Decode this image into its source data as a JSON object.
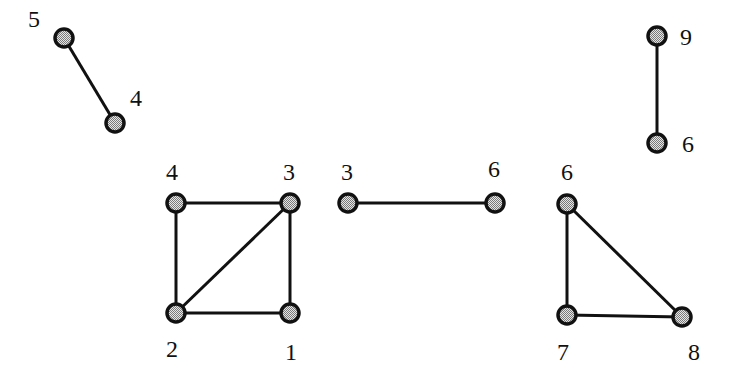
{
  "diagram": {
    "type": "graph-components",
    "colors": {
      "stroke": "#111111",
      "node_fill": "#bdbdbd",
      "background": "#ffffff"
    },
    "components": [
      {
        "id": "component-a",
        "nodes": [
          {
            "label": "5",
            "x": 64,
            "y": 38,
            "lx": 28,
            "ly": 27
          },
          {
            "label": "4",
            "x": 115,
            "y": 123,
            "lx": 130,
            "ly": 106
          }
        ],
        "edges": [
          [
            0,
            1
          ]
        ]
      },
      {
        "id": "component-b",
        "nodes": [
          {
            "label": "4",
            "x": 176,
            "y": 203,
            "lx": 166,
            "ly": 180
          },
          {
            "label": "3",
            "x": 290,
            "y": 203,
            "lx": 283,
            "ly": 180
          },
          {
            "label": "2",
            "x": 176,
            "y": 313,
            "lx": 166,
            "ly": 357
          },
          {
            "label": "1",
            "x": 290,
            "y": 313,
            "lx": 285,
            "ly": 360
          }
        ],
        "edges": [
          [
            0,
            1
          ],
          [
            0,
            2
          ],
          [
            1,
            3
          ],
          [
            2,
            3
          ],
          [
            1,
            2
          ]
        ]
      },
      {
        "id": "component-c",
        "nodes": [
          {
            "label": "3",
            "x": 348,
            "y": 203,
            "lx": 341,
            "ly": 180
          },
          {
            "label": "6",
            "x": 495,
            "y": 203,
            "lx": 488,
            "ly": 177
          }
        ],
        "edges": [
          [
            0,
            1
          ]
        ]
      },
      {
        "id": "component-d",
        "nodes": [
          {
            "label": "6",
            "x": 567,
            "y": 204,
            "lx": 561,
            "ly": 180
          },
          {
            "label": "7",
            "x": 567,
            "y": 315,
            "lx": 557,
            "ly": 360
          },
          {
            "label": "8",
            "x": 682,
            "y": 317,
            "lx": 688,
            "ly": 360
          }
        ],
        "edges": [
          [
            0,
            1
          ],
          [
            0,
            2
          ],
          [
            1,
            2
          ]
        ]
      },
      {
        "id": "component-e",
        "nodes": [
          {
            "label": "9",
            "x": 657,
            "y": 36,
            "lx": 680,
            "ly": 45
          },
          {
            "label": "6",
            "x": 657,
            "y": 143,
            "lx": 682,
            "ly": 152
          }
        ],
        "edges": [
          [
            0,
            1
          ]
        ]
      }
    ]
  }
}
